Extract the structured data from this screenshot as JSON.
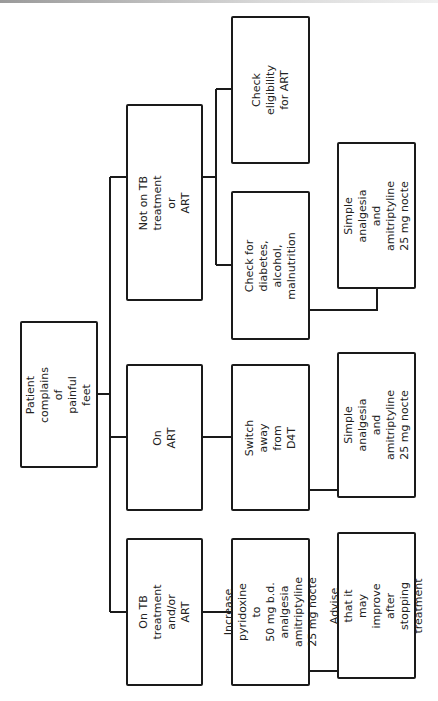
{
  "diagram": {
    "type": "flowchart",
    "orientation": "rotated-90-ccw",
    "nodes": {
      "root": {
        "label": "Patient complains of\npainful feet"
      },
      "not_on_tb": {
        "label": "Not on TB treatment or\nART"
      },
      "on_art": {
        "label": "On ART"
      },
      "on_tb": {
        "label": "On TB treatment and/or\nART"
      },
      "check_eligibility": {
        "label": "Check eligibility for ART"
      },
      "check_diabetes": {
        "label": "Check for diabetes, alcohol,\nmalnutrition"
      },
      "simple_analgesia_1": {
        "label": "Simple analgesia and\namitriptyline 25 mg nocte"
      },
      "switch_d4t": {
        "label": "Switch away from D4T"
      },
      "simple_analgesia_2": {
        "label": "Simple analgesia and\namitriptyline 25 mg nocte"
      },
      "increase_pyridoxine": {
        "label": "Increase pyridoxine to\n50 mg b.d.\nanalgesia\namitriptyline 25 mg nocte"
      },
      "advise": {
        "label": "Advise that it may improve\nafter stopping treatment"
      }
    },
    "edges": [
      [
        "root",
        "not_on_tb"
      ],
      [
        "root",
        "on_art"
      ],
      [
        "root",
        "on_tb"
      ],
      [
        "not_on_tb",
        "check_eligibility"
      ],
      [
        "not_on_tb",
        "check_diabetes"
      ],
      [
        "check_diabetes",
        "simple_analgesia_1"
      ],
      [
        "on_art",
        "switch_d4t"
      ],
      [
        "switch_d4t",
        "simple_analgesia_2"
      ],
      [
        "on_tb",
        "increase_pyridoxine"
      ],
      [
        "increase_pyridoxine",
        "advise"
      ]
    ]
  }
}
